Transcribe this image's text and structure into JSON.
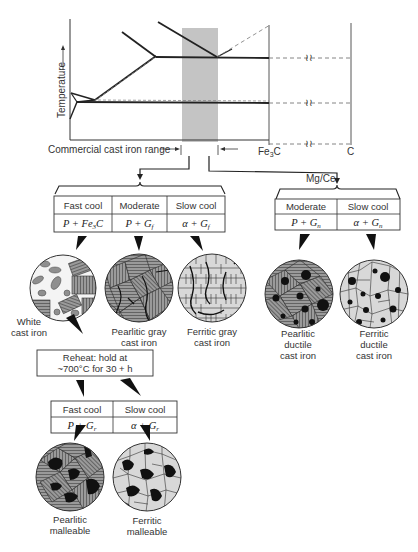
{
  "phase_diagram": {
    "y_axis_label": "Temperature",
    "range_label": "Commercial cast iron range",
    "x_label_fe3c": "Fe",
    "x_label_fe3c_sub": "3",
    "x_label_fe3c_tail": "C",
    "x_label_c": "C",
    "break_symbol": "≀≀"
  },
  "branch_label_mgce": "Mg/Ce",
  "gray_table": {
    "headers": [
      "Fast cool",
      "Moderate",
      "Slow cool"
    ],
    "phases": [
      {
        "main": "P + Fe",
        "sub": "3",
        "tail": "C"
      },
      {
        "main": "P + G",
        "sub": "f",
        "tail": ""
      },
      {
        "main": "α + G",
        "sub": "f",
        "tail": ""
      }
    ]
  },
  "ductile_table": {
    "headers": [
      "Moderate",
      "Slow cool"
    ],
    "phases": [
      {
        "main": "P + G",
        "sub": "n",
        "tail": ""
      },
      {
        "main": "α + G",
        "sub": "n",
        "tail": ""
      }
    ]
  },
  "reheat_box": {
    "line1": "Reheat: hold at",
    "line2": "~700°C for 30 + h"
  },
  "malleable_table": {
    "headers": [
      "Fast cool",
      "Slow cool"
    ],
    "phases": [
      {
        "main": "P + G",
        "sub": "r",
        "tail": ""
      },
      {
        "main": "α + G",
        "sub": "r",
        "tail": ""
      }
    ]
  },
  "microstructures": [
    {
      "id": "white",
      "line1": "White",
      "line2": "cast iron",
      "line3": ""
    },
    {
      "id": "pearlitic-gray",
      "line1": "Pearlitic gray",
      "line2": "cast iron",
      "line3": ""
    },
    {
      "id": "ferritic-gray",
      "line1": "Ferritic gray",
      "line2": "cast iron",
      "line3": ""
    },
    {
      "id": "pearlitic-ductile",
      "line1": "Pearlitic",
      "line2": "ductile",
      "line3": "cast iron"
    },
    {
      "id": "ferritic-ductile",
      "line1": "Ferritic",
      "line2": "ductile",
      "line3": "cast iron"
    },
    {
      "id": "pearlitic-malleable",
      "line1": "Pearlitic",
      "line2": "malleable",
      "line3": ""
    },
    {
      "id": "ferritic-malleable",
      "line1": "Ferritic",
      "line2": "malleable",
      "line3": ""
    }
  ],
  "colors": {
    "line": "#2a2a2a",
    "range_shade": "#bdbdbd",
    "pearlite": "#8a8a8a",
    "ferrite": "#d6d6d6",
    "graphite": "#111111"
  }
}
